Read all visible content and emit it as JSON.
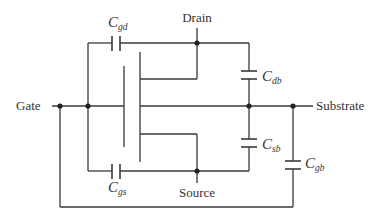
{
  "diagram": {
    "terminals": {
      "gate": "Gate",
      "drain": "Drain",
      "source": "Source",
      "substrate": "Substrate"
    },
    "capacitors": {
      "cgd": {
        "main": "C",
        "sub": "gd"
      },
      "cgs": {
        "main": "C",
        "sub": "gs"
      },
      "cdb": {
        "main": "C",
        "sub": "db"
      },
      "csb": {
        "main": "C",
        "sub": "sb"
      },
      "cgb": {
        "main": "C",
        "sub": "gb"
      }
    },
    "colors": {
      "line": "#3a3a3a",
      "node": "#222222",
      "text": "#333333",
      "background": "#ffffff"
    }
  }
}
